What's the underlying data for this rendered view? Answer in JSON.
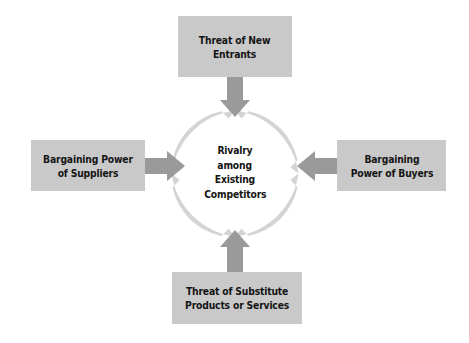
{
  "diagram": {
    "background_color": "#ffffff",
    "box_fill_color": "#c9c9c9",
    "ring_color": "#d4d4d4",
    "arrow_color": "#9a9a9a",
    "text_color": "#141414"
  },
  "center": {
    "name": "rivalry-among-existing-competitors",
    "lines": [
      "Rivalry",
      "among",
      "Existing",
      "Competitors"
    ],
    "text": "Rivalry among Existing Competitors"
  },
  "forces": {
    "top": {
      "name": "threat-of-new-entrants",
      "text": "Threat of New\nEntrants",
      "arrow_direction": "down"
    },
    "left": {
      "name": "bargaining-power-of-suppliers",
      "text": "Bargaining Power\nof Suppliers",
      "arrow_direction": "right"
    },
    "right": {
      "name": "bargaining-power-of-buyers",
      "text": "Bargaining\nPower of Buyers",
      "arrow_direction": "left"
    },
    "bottom": {
      "name": "threat-of-substitute-products-or-services",
      "text": "Threat of Substitute\nProducts or Services",
      "arrow_direction": "up"
    }
  }
}
